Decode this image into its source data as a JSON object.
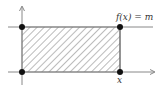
{
  "diagram": {
    "labels": {
      "function": "f(x) = m",
      "x_label": "x"
    },
    "colors": {
      "axis": "#555555",
      "line": "#888888",
      "hatch": "#555555",
      "dot": "#111111"
    },
    "points": [
      {
        "name": "origin",
        "x": 22,
        "y": 72
      },
      {
        "name": "top-left",
        "x": 22,
        "y": 27
      },
      {
        "name": "top-right",
        "x": 120,
        "y": 27
      },
      {
        "name": "bottom-right",
        "x": 120,
        "y": 72
      }
    ]
  }
}
